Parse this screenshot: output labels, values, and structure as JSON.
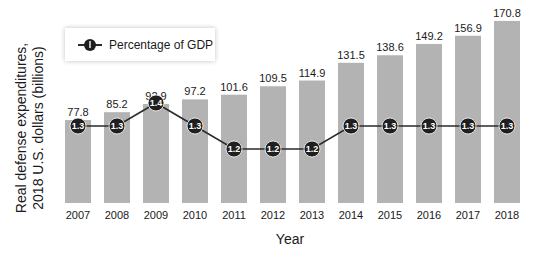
{
  "chart_data": {
    "type": "bar",
    "title": "",
    "xlabel": "Year",
    "ylabel": "Real defense expenditures, 2018 U.S. dollars (billions)",
    "ylabel_lines": [
      "Real defense expenditures,",
      "2018 U.S. dollars (billions)"
    ],
    "categories": [
      "2007",
      "2008",
      "2009",
      "2010",
      "2011",
      "2012",
      "2013",
      "2014",
      "2015",
      "2016",
      "2017",
      "2018"
    ],
    "series": [
      {
        "name": "Real defense expenditures (billions, 2018 USD)",
        "type": "bar",
        "values": [
          77.8,
          85.2,
          92.9,
          97.2,
          101.6,
          109.5,
          114.9,
          131.5,
          138.6,
          149.2,
          156.9,
          170.8
        ],
        "value_labels": [
          "77.8",
          "85.2",
          "92.9",
          "97.2",
          "101.6",
          "109.5",
          "114.9",
          "131.5",
          "138.6",
          "149.2",
          "156.9",
          "170.8"
        ],
        "color": "#b3b3b3"
      },
      {
        "name": "Percentage of GDP",
        "type": "line",
        "values": [
          1.3,
          1.3,
          1.4,
          1.3,
          1.2,
          1.2,
          1.2,
          1.3,
          1.3,
          1.3,
          1.3,
          1.3
        ],
        "value_labels": [
          "1.3",
          "1.3",
          "1.4",
          "1.3",
          "1.2",
          "1.2",
          "1.2",
          "1.3",
          "1.3",
          "1.3",
          "1.3",
          "1.3"
        ],
        "color": "#1f1f1f"
      }
    ],
    "legend": {
      "entries": [
        "Percentage of GDP"
      ],
      "position": "top-left"
    },
    "grid": false,
    "ylim": [
      0,
      180
    ]
  }
}
